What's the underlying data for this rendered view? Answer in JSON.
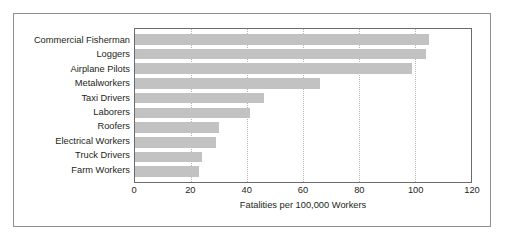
{
  "chart_data": {
    "type": "bar",
    "orientation": "horizontal",
    "title": "",
    "xlabel": "Fatalities per 100,000 Workers",
    "ylabel": "",
    "categories": [
      "Commercial Fisherman",
      "Loggers",
      "Airplane Pilots",
      "Metalworkers",
      "Taxi Drivers",
      "Laborers",
      "Roofers",
      "Electrical Workers",
      "Truck Drivers",
      "Farm Workers"
    ],
    "values": [
      105,
      104,
      99,
      66,
      46,
      41,
      30,
      29,
      24,
      23
    ],
    "xlim": [
      0,
      120
    ],
    "xticks": [
      0,
      20,
      40,
      60,
      80,
      100,
      120
    ],
    "xtick_labels": [
      "0",
      "20",
      "40",
      "60",
      "80",
      "100",
      "120"
    ],
    "grid": "vertical-dotted",
    "legend": "none",
    "bar_color": "#c2c2c2",
    "frame_color": "#6b6b6b",
    "gridline_color": "#b5b5b5",
    "text_color": "#231f20"
  }
}
